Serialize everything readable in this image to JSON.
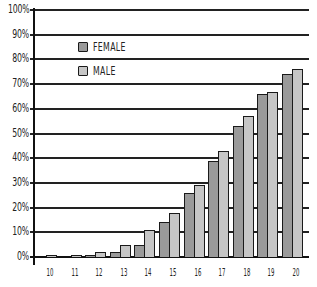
{
  "chart_data": {
    "type": "bar",
    "title": "",
    "xlabel": "",
    "ylabel": "",
    "categories": [
      "10",
      "11",
      "12",
      "13",
      "14",
      "15",
      "16",
      "17",
      "18",
      "19",
      "20"
    ],
    "series": [
      {
        "name": "FEMALE",
        "color": "#9a9a9a",
        "values": [
          0,
          0,
          1,
          2,
          5,
          14,
          26,
          39,
          53,
          66,
          74
        ]
      },
      {
        "name": "MALE",
        "color": "#c6c6c6",
        "values": [
          1,
          1,
          2,
          5,
          11,
          18,
          29,
          43,
          57,
          67,
          76
        ]
      }
    ],
    "ylim": [
      0,
      100
    ],
    "yticks": [
      "0%",
      "10%",
      "20%",
      "30%",
      "40%",
      "50%",
      "60%",
      "70%",
      "80%",
      "90%",
      "100%"
    ],
    "grid": true,
    "legend_position": "upper-left (inside plot)"
  },
  "legend": {
    "items": [
      {
        "label": "FEMALE",
        "color": "#9a9a9a"
      },
      {
        "label": "MALE",
        "color": "#c6c6c6"
      }
    ]
  },
  "colors": {
    "axis": "#111111",
    "grid": "#222222",
    "bar_outline": "#1a1a1a",
    "background": "#ffffff"
  }
}
